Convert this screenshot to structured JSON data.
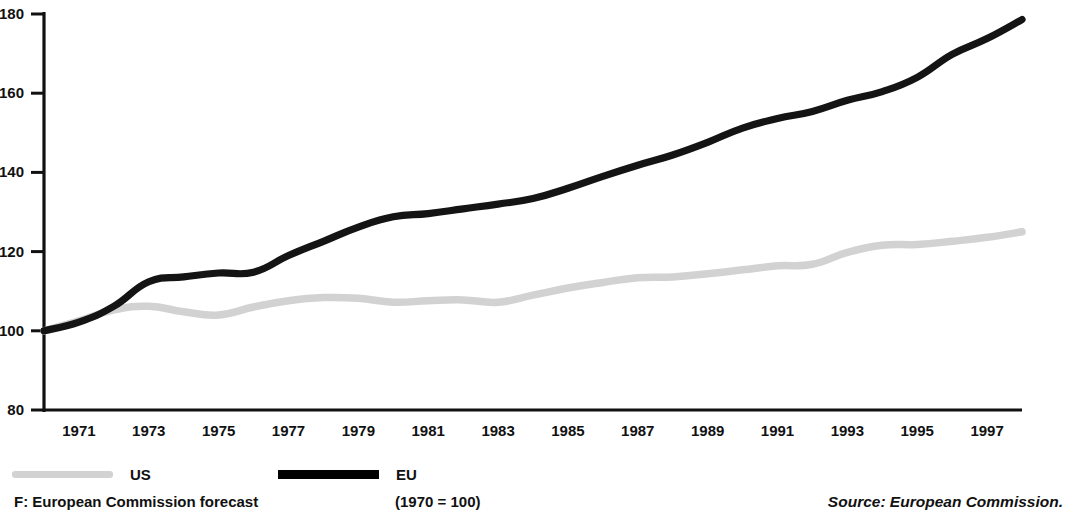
{
  "chart_data": {
    "type": "line",
    "title": "",
    "subtitle": "",
    "xlabel": "",
    "ylabel": "",
    "xlim": [
      1970,
      1998
    ],
    "ylim": [
      80,
      180
    ],
    "grid": false,
    "legend_position": "bottom-left",
    "ytick_labels": [
      "180",
      "160",
      "140",
      "120",
      "100",
      "80"
    ],
    "ytick_values": [
      180,
      160,
      140,
      120,
      100,
      80
    ],
    "xtick_labels": [
      "1971",
      "1973",
      "1975",
      "1977",
      "1979",
      "1981",
      "1983",
      "1985",
      "1987",
      "1989",
      "1991",
      "1993",
      "1995",
      "1997"
    ],
    "xtick_values": [
      1971,
      1973,
      1975,
      1977,
      1979,
      1981,
      1983,
      1985,
      1987,
      1989,
      1991,
      1993,
      1995,
      1997
    ],
    "x": [
      1970,
      1971,
      1972,
      1973,
      1974,
      1975,
      1976,
      1977,
      1978,
      1979,
      1980,
      1981,
      1982,
      1983,
      1984,
      1985,
      1986,
      1987,
      1988,
      1989,
      1990,
      1991,
      1992,
      1993,
      1994,
      1995,
      1996,
      1997,
      1998
    ],
    "series": [
      {
        "name": "US",
        "color": "#d2d2d2",
        "values": [
          100.0,
          102.5,
          105.3,
          106.2,
          104.8,
          104.0,
          106.0,
          107.6,
          108.4,
          108.2,
          107.2,
          107.6,
          107.8,
          107.2,
          109.0,
          110.8,
          112.2,
          113.4,
          113.6,
          114.4,
          115.4,
          116.4,
          116.8,
          119.8,
          121.6,
          121.8,
          122.6,
          123.6,
          125.0
        ]
      },
      {
        "name": "EU",
        "color": "#141414",
        "values": [
          100.0,
          102.2,
          106.2,
          112.4,
          113.6,
          114.6,
          114.8,
          119.0,
          122.6,
          126.2,
          128.8,
          129.6,
          130.8,
          132.0,
          133.4,
          136.0,
          139.0,
          141.8,
          144.4,
          147.6,
          151.2,
          153.6,
          155.4,
          158.2,
          160.4,
          164.0,
          169.8,
          173.8,
          178.6
        ]
      }
    ],
    "annotations": []
  },
  "legend": {
    "items": [
      {
        "label": "US",
        "swatch": "us-swatch"
      },
      {
        "label": "EU",
        "swatch": "eu-swatch"
      }
    ]
  },
  "footer": {
    "forecast_note": "F: European Commission forecast",
    "base_note": "(1970 = 100)",
    "source": "Source: European Commission."
  }
}
